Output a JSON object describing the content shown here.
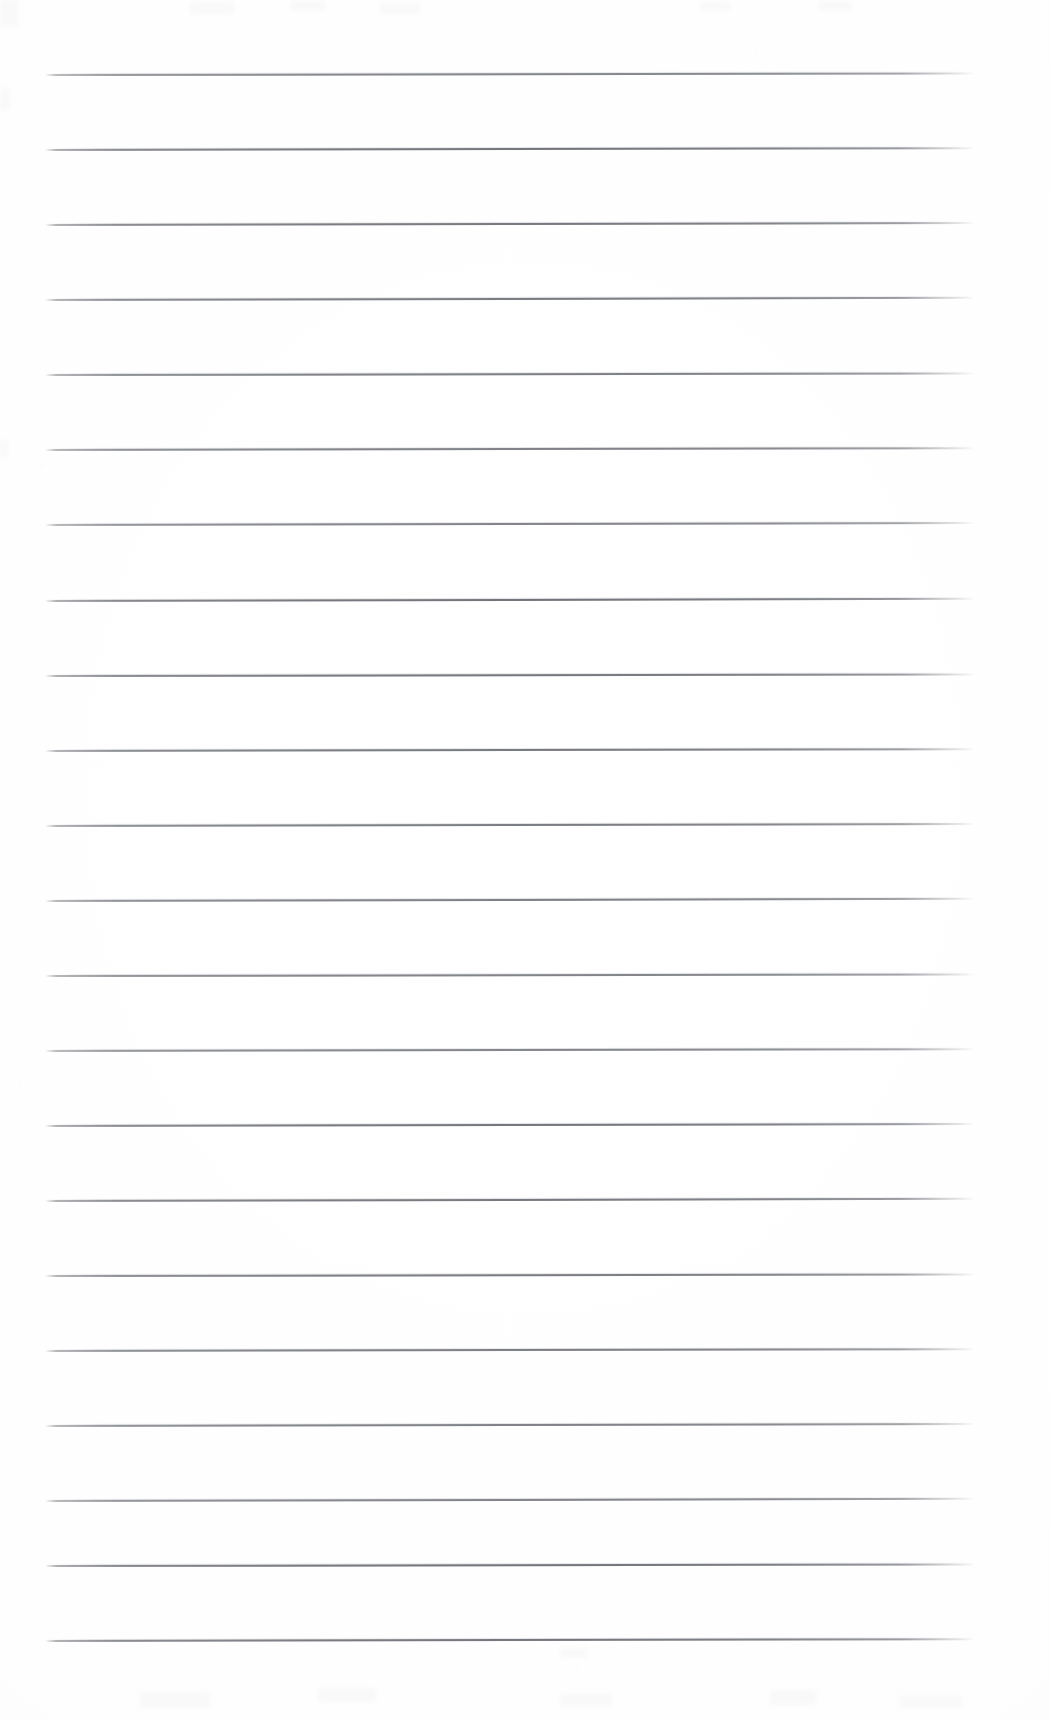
{
  "document": {
    "kind": "scanned-blank-ruled-paper",
    "title": "Blank ruled notebook page (scan)",
    "page_width": 1050,
    "page_height": 1721,
    "background_color": "#ffffff",
    "paper_tone_color": "#fdfdfd",
    "has_visible_text": false,
    "text_content": ""
  },
  "ruling": {
    "line_color": "#686b71",
    "line_thickness": 2,
    "line_count": 22,
    "line_left_x": 45,
    "line_right_x": 975,
    "line_width": 930,
    "first_line_y": 74,
    "line_spacing": 75.1,
    "skew_note": "lines sit a couple of pixels lower at the left than the right",
    "line_positions_y": [
      74,
      149,
      224,
      299,
      374,
      449,
      524,
      600,
      675,
      750,
      825,
      900,
      975,
      1050,
      1125,
      1200,
      1275,
      1350,
      1425,
      1500,
      1565,
      1640
    ]
  },
  "margins": {
    "top_margin": 74,
    "bottom_margin": 81,
    "left_margin": 45,
    "right_margin": 75
  },
  "artifacts": {
    "top_edge_smudges": [
      {
        "x": 0,
        "y": 0,
        "w": 18,
        "h": 26
      },
      {
        "x": 190,
        "y": 2,
        "w": 44,
        "h": 12
      },
      {
        "x": 290,
        "y": 1,
        "w": 36,
        "h": 10
      },
      {
        "x": 380,
        "y": 3,
        "w": 40,
        "h": 11
      },
      {
        "x": 700,
        "y": 2,
        "w": 30,
        "h": 9
      },
      {
        "x": 818,
        "y": 1,
        "w": 34,
        "h": 10
      }
    ],
    "bottom_edge_smudges": [
      {
        "x": 140,
        "y": 1692,
        "w": 70,
        "h": 16
      },
      {
        "x": 318,
        "y": 1688,
        "w": 58,
        "h": 14
      },
      {
        "x": 560,
        "y": 1694,
        "w": 52,
        "h": 13
      },
      {
        "x": 770,
        "y": 1690,
        "w": 46,
        "h": 15
      },
      {
        "x": 900,
        "y": 1696,
        "w": 62,
        "h": 12
      },
      {
        "x": 560,
        "y": 1648,
        "w": 28,
        "h": 10
      }
    ],
    "left_edge_smudges": [
      {
        "x": 0,
        "y": 88,
        "w": 10,
        "h": 22
      },
      {
        "x": 0,
        "y": 440,
        "w": 8,
        "h": 18
      }
    ]
  }
}
